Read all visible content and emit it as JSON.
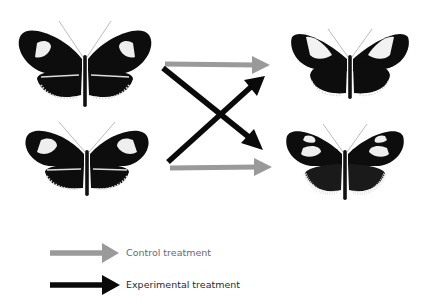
{
  "figure": {
    "top_fragment": "",
    "panels": {
      "left_top": {
        "label": "butterfly-parent-1",
        "pattern": "two white forewing bars, white-fringed hindwing"
      },
      "left_bottom": {
        "label": "butterfly-parent-2",
        "pattern": "white forewing patches, white-fringed hindwing"
      },
      "right_top": {
        "label": "butterfly-outcome-1",
        "pattern": "broad white forewing band, dark hindwing"
      },
      "right_bottom": {
        "label": "butterfly-outcome-2",
        "pattern": "white forewing patches, pale hindwing fringe"
      }
    },
    "arrows": [
      {
        "type": "control",
        "from": "left_top",
        "to": "right_top"
      },
      {
        "type": "experimental",
        "from": "left_top",
        "to": "right_bottom"
      },
      {
        "type": "experimental",
        "from": "left_bottom",
        "to": "right_top"
      },
      {
        "type": "control",
        "from": "left_bottom",
        "to": "right_bottom"
      }
    ],
    "colors": {
      "control": "#9a9a9a",
      "experimental": "#0a0a0a",
      "wing": "#0d0d0d",
      "pale": "#f2f2f2"
    }
  },
  "legend": {
    "items": [
      {
        "label": "Control treatment",
        "color": "#9a9a9a"
      },
      {
        "label": "Experimental treatment",
        "color": "#0a0a0a"
      }
    ]
  }
}
